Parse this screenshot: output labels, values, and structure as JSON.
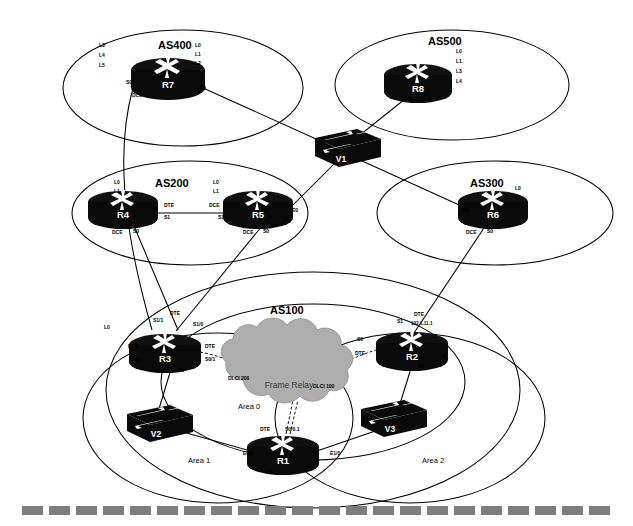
{
  "diagram": {
    "background_color": "#ffffff",
    "line_color": "#000000",
    "device_color": "#0a0a0a",
    "cloud_color": "#adadad",
    "footer_dash_color": "#7d7d7d"
  },
  "domains": [
    {
      "id": "as400",
      "label": "AS400",
      "cx": 183,
      "cy": 88,
      "rx": 120,
      "ry": 58
    },
    {
      "id": "as500",
      "label": "AS500",
      "cx": 452,
      "cy": 85,
      "rx": 117,
      "ry": 55
    },
    {
      "id": "as200",
      "label": "AS200",
      "cx": 190,
      "cy": 213,
      "rx": 118,
      "ry": 52
    },
    {
      "id": "as300",
      "label": "AS300",
      "cx": 495,
      "cy": 213,
      "rx": 118,
      "ry": 52
    },
    {
      "id": "as100",
      "label": "AS100",
      "cx": 313,
      "cy": 390,
      "rx": 207,
      "ry": 118
    },
    {
      "id": "area0",
      "label": "Area 0",
      "cx": 313,
      "cy": 382,
      "rx": 152,
      "ry": 78
    },
    {
      "id": "area1",
      "label": "Area 1",
      "cx": 218,
      "cy": 418,
      "rx": 135,
      "ry": 85
    },
    {
      "id": "area2",
      "label": "Area 2",
      "cx": 410,
      "cy": 418,
      "rx": 135,
      "ry": 85
    }
  ],
  "area_labels": [
    {
      "id": "area0-label",
      "text": "Area 0",
      "x": 238,
      "y": 409
    },
    {
      "id": "area1-label",
      "text": "Area 1",
      "x": 188,
      "y": 463
    },
    {
      "id": "area2-label",
      "text": "Area 2",
      "x": 422,
      "y": 463
    }
  ],
  "routers": [
    {
      "id": "r7",
      "name": "R7",
      "x": 168,
      "y": 75
    },
    {
      "id": "r8",
      "name": "R8",
      "x": 418,
      "y": 80
    },
    {
      "id": "r4",
      "name": "R4",
      "x": 123,
      "y": 207
    },
    {
      "id": "r5",
      "name": "R5",
      "x": 258,
      "y": 207
    },
    {
      "id": "r6",
      "name": "R6",
      "x": 493,
      "y": 207
    },
    {
      "id": "r3",
      "name": "R3",
      "x": 165,
      "y": 350
    },
    {
      "id": "r2",
      "name": "R2",
      "x": 412,
      "y": 348
    },
    {
      "id": "r1",
      "name": "R1",
      "x": 283,
      "y": 452
    }
  ],
  "switches": [
    {
      "id": "v1",
      "name": "V1",
      "x": 341,
      "y": 146
    },
    {
      "id": "v2",
      "name": "V2",
      "x": 155,
      "y": 424
    },
    {
      "id": "v3",
      "name": "V3",
      "x": 389,
      "y": 419
    }
  ],
  "cloud": {
    "id": "frame-relay-cloud",
    "label": "Frame Relay",
    "label_x": 289,
    "label_y": 388,
    "cx": 297,
    "cy": 385
  },
  "interface_labels": [
    {
      "id": "r7-l3",
      "text": "L3",
      "x": 99,
      "y": 47
    },
    {
      "id": "r7-l4",
      "text": "L4",
      "x": 99,
      "y": 57
    },
    {
      "id": "r7-l5",
      "text": "L5",
      "x": 99,
      "y": 67
    },
    {
      "id": "r7-l0",
      "text": "L0",
      "x": 195,
      "y": 47
    },
    {
      "id": "r7-l1",
      "text": "L1",
      "x": 195,
      "y": 56
    },
    {
      "id": "r7-l2",
      "text": "L2",
      "x": 195,
      "y": 65
    },
    {
      "id": "r7-s0",
      "text": "S0",
      "x": 126,
      "y": 84
    },
    {
      "id": "r7-dce",
      "text": "DCE",
      "x": 132,
      "y": 97
    },
    {
      "id": "r7-e0",
      "text": "E0",
      "x": 200,
      "y": 90
    },
    {
      "id": "r8-l0",
      "text": "L0",
      "x": 456,
      "y": 53
    },
    {
      "id": "r8-l1",
      "text": "L1",
      "x": 456,
      "y": 63
    },
    {
      "id": "r8-l3",
      "text": "L3",
      "x": 456,
      "y": 73
    },
    {
      "id": "r8-l4",
      "text": "L4",
      "x": 456,
      "y": 83
    },
    {
      "id": "r8-e0",
      "text": "E0",
      "x": 406,
      "y": 101
    },
    {
      "id": "r4-l0",
      "text": "L0",
      "x": 114,
      "y": 184
    },
    {
      "id": "r4-l1",
      "text": "L1",
      "x": 114,
      "y": 193
    },
    {
      "id": "r4-dte",
      "text": "DTE",
      "x": 164,
      "y": 207
    },
    {
      "id": "r4-s1",
      "text": "S1",
      "x": 164,
      "y": 219
    },
    {
      "id": "r4-dce",
      "text": "DCE",
      "x": 112,
      "y": 234
    },
    {
      "id": "r4-s0",
      "text": "S0",
      "x": 133,
      "y": 233
    },
    {
      "id": "r5-l0",
      "text": "L0",
      "x": 213,
      "y": 184
    },
    {
      "id": "r5-l1",
      "text": "L1",
      "x": 213,
      "y": 193
    },
    {
      "id": "r5-dce",
      "text": "DCE",
      "x": 209,
      "y": 207
    },
    {
      "id": "r5-s1",
      "text": "S1",
      "x": 218,
      "y": 219
    },
    {
      "id": "r5-e0",
      "text": "E0",
      "x": 292,
      "y": 212
    },
    {
      "id": "r5-dce2",
      "text": "DCE",
      "x": 243,
      "y": 234
    },
    {
      "id": "r5-s0",
      "text": "S0",
      "x": 263,
      "y": 233
    },
    {
      "id": "r6-e0",
      "text": "E0",
      "x": 463,
      "y": 212
    },
    {
      "id": "r6-l0",
      "text": "L0",
      "x": 515,
      "y": 190
    },
    {
      "id": "r6-l1",
      "text": "L1",
      "x": 515,
      "y": 199
    },
    {
      "id": "r6-dce",
      "text": "DCE",
      "x": 466,
      "y": 234
    },
    {
      "id": "r6-s0",
      "text": "S0",
      "x": 487,
      "y": 233
    },
    {
      "id": "r3-s11",
      "text": "S1/1",
      "x": 153,
      "y": 322
    },
    {
      "id": "r3-dte-top",
      "text": "DTE",
      "x": 170,
      "y": 315
    },
    {
      "id": "r3-s10",
      "text": "S1/0",
      "x": 193,
      "y": 326
    },
    {
      "id": "r3-l0",
      "text": "L0",
      "x": 104,
      "y": 329
    },
    {
      "id": "r3-dte-left",
      "text": "DTE",
      "x": 128,
      "y": 348
    },
    {
      "id": "r3-s00",
      "text": "S0/0",
      "x": 130,
      "y": 361
    },
    {
      "id": "r3-dte-right",
      "text": "DTE",
      "x": 205,
      "y": 348
    },
    {
      "id": "r3-s01",
      "text": "S0/1",
      "x": 205,
      "y": 361
    },
    {
      "id": "r3-e0",
      "text": "E0",
      "x": 178,
      "y": 372
    },
    {
      "id": "r2-s1",
      "text": "S1",
      "x": 397,
      "y": 323
    },
    {
      "id": "r2-dte-top",
      "text": "DTE",
      "x": 414,
      "y": 316
    },
    {
      "id": "r2-ip",
      "text": "192.1.11.1",
      "x": 411,
      "y": 325
    },
    {
      "id": "r2-s0",
      "text": "S0",
      "x": 357,
      "y": 341
    },
    {
      "id": "r2-dte-left",
      "text": "DTE",
      "x": 355,
      "y": 355
    },
    {
      "id": "r2-l0",
      "text": "L0",
      "x": 440,
      "y": 358
    },
    {
      "id": "r2-e0",
      "text": "E0",
      "x": 418,
      "y": 368
    },
    {
      "id": "r1-dte",
      "text": "DTE",
      "x": 260,
      "y": 431
    },
    {
      "id": "r1-s001",
      "text": "S0/0.1",
      "x": 285,
      "y": 431
    },
    {
      "id": "r1-e00",
      "text": "E0/0",
      "x": 243,
      "y": 455
    },
    {
      "id": "r1-e10",
      "text": "E1/0",
      "x": 330,
      "y": 455
    },
    {
      "id": "r1-l0",
      "text": "L0",
      "x": 266,
      "y": 474
    },
    {
      "id": "dlci-200",
      "text": "DLCI 200",
      "x": 228,
      "y": 380
    },
    {
      "id": "dlci-100",
      "text": "DLCI 100",
      "x": 313,
      "y": 388
    }
  ],
  "links": [
    {
      "id": "r7-to-r3",
      "from": "R7 S0",
      "to": "R3 S1/1"
    },
    {
      "id": "r7-to-v1",
      "from": "R7 E0",
      "to": "V1"
    },
    {
      "id": "r8-to-v1",
      "from": "R8 E0",
      "to": "V1"
    },
    {
      "id": "r4-to-r5",
      "from": "R4 S1 DTE",
      "to": "R5 S1 DCE"
    },
    {
      "id": "r4-to-r3",
      "from": "R4 S0 DCE",
      "to": "R3 S1/0"
    },
    {
      "id": "r5-to-v1",
      "from": "R5 E0",
      "to": "V1"
    },
    {
      "id": "r5-to-r3",
      "from": "R5 S0 DCE",
      "to": "R3"
    },
    {
      "id": "r6-to-v1",
      "from": "R6 E0",
      "to": "V1"
    },
    {
      "id": "r6-to-r2",
      "from": "R6 S0 DCE",
      "to": "R2 S1"
    },
    {
      "id": "r3-to-cloud",
      "from": "R3 S0/1 DTE",
      "to": "Frame Relay"
    },
    {
      "id": "r2-to-cloud",
      "from": "R2 S0 DTE",
      "to": "Frame Relay"
    },
    {
      "id": "r1-to-cloud",
      "from": "R1 S0/0.1 DTE",
      "to": "Frame Relay"
    },
    {
      "id": "r3-to-v2",
      "from": "R3 E0",
      "to": "V2"
    },
    {
      "id": "r2-to-v3",
      "from": "R2 E0",
      "to": "V3"
    },
    {
      "id": "v2-to-r1",
      "from": "V2",
      "to": "R1 E0/0"
    },
    {
      "id": "v3-to-r1",
      "from": "V3",
      "to": "R1 E1/0"
    }
  ],
  "footer": {
    "id": "footer-dashed-rule",
    "segments": 22
  }
}
